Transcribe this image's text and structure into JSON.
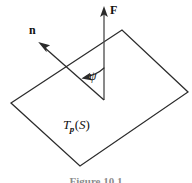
{
  "figure": {
    "caption": "Figure 10.1",
    "stroke_color": "#2b2b2b",
    "background_color": "#ffffff",
    "labels": {
      "normal_vector": "n",
      "force_vector": "F",
      "angle": "ψ",
      "tangent_plane_main": "T",
      "tangent_plane_sub": "p",
      "tangent_plane_open": "(",
      "tangent_plane_surface": "S",
      "tangent_plane_close": ")"
    }
  },
  "geometry": {
    "tangent_plane_polygon": {
      "name": "tangent-plane-parallelogram",
      "vertices": [
        [
          11,
          103
        ],
        [
          122,
          30
        ],
        [
          188,
          92
        ],
        [
          80,
          166
        ]
      ]
    },
    "force_vector": {
      "name": "force-vector-F",
      "from": [
        104,
        100
      ],
      "to": [
        104,
        8
      ]
    },
    "normal_vector": {
      "name": "normal-vector-n",
      "from": [
        104,
        100
      ],
      "to": [
        39,
        43
      ]
    },
    "angle_arc": {
      "name": "angle-arc-psi",
      "start": [
        104,
        62
      ],
      "end": [
        82,
        78
      ],
      "radius": 30
    }
  }
}
